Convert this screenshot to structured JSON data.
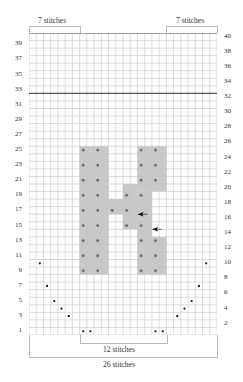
{
  "chart_title": "Knitting chart",
  "grid": {
    "columns": 26,
    "rows": 40,
    "thick_lines_above_rows": [
      40,
      32
    ],
    "shade_color": "#c8c8c8",
    "line_color": "#c4c4c4",
    "thick_line_color": "#555555"
  },
  "top_labels": {
    "left": "7 stitches",
    "right": "7 stitches"
  },
  "bottom_labels": {
    "inner": "12 stitches",
    "outer": "26 stitches"
  },
  "row_numbers_left": [
    "39",
    "37",
    "35",
    "33",
    "31",
    "29",
    "27",
    "25",
    "23",
    "21",
    "19",
    "17",
    "15",
    "13",
    "11",
    "9",
    "7",
    "5",
    "3",
    "1"
  ],
  "row_numbers_right": [
    "40",
    "38",
    "36",
    "34",
    "32",
    "30",
    "28",
    "26",
    "24",
    "22",
    "20",
    "18",
    "16",
    "14",
    "12",
    "10",
    "8",
    "6",
    "4",
    "2"
  ],
  "shaded_cells": {
    "left_bar": {
      "cols": [
        8,
        11
      ],
      "rows": [
        9,
        25
      ]
    },
    "right_bar_top": {
      "cols": [
        16,
        19
      ],
      "rows": [
        20,
        25
      ]
    },
    "right_bar_bottom": {
      "cols": [
        16,
        19
      ],
      "rows": [
        9,
        13
      ]
    },
    "middle_a": {
      "cols": [
        16,
        17
      ],
      "rows": [
        14,
        19
      ]
    },
    "middle_b": {
      "cols": [
        14,
        15
      ],
      "rows": [
        15,
        20
      ]
    },
    "middle_c": {
      "cols": [
        12,
        13
      ],
      "rows": [
        17,
        18
      ]
    }
  },
  "dots_gray": [
    [
      8,
      25
    ],
    [
      10,
      25
    ],
    [
      16,
      25
    ],
    [
      18,
      25
    ],
    [
      8,
      23
    ],
    [
      10,
      23
    ],
    [
      16,
      23
    ],
    [
      18,
      23
    ],
    [
      8,
      21
    ],
    [
      10,
      21
    ],
    [
      16,
      21
    ],
    [
      18,
      21
    ],
    [
      8,
      19
    ],
    [
      10,
      19
    ],
    [
      14,
      19
    ],
    [
      16,
      19
    ],
    [
      8,
      17
    ],
    [
      10,
      17
    ],
    [
      12,
      17
    ],
    [
      14,
      17
    ],
    [
      8,
      15
    ],
    [
      10,
      15
    ],
    [
      14,
      15
    ],
    [
      16,
      15
    ],
    [
      8,
      13
    ],
    [
      10,
      13
    ],
    [
      16,
      13
    ],
    [
      18,
      13
    ],
    [
      8,
      11
    ],
    [
      10,
      11
    ],
    [
      16,
      11
    ],
    [
      18,
      11
    ],
    [
      8,
      9
    ],
    [
      10,
      9
    ],
    [
      16,
      9
    ],
    [
      18,
      9
    ]
  ],
  "dots_black": [
    [
      2,
      10
    ],
    [
      3,
      7
    ],
    [
      4,
      5
    ],
    [
      5,
      4
    ],
    [
      6,
      3
    ],
    [
      8,
      1
    ],
    [
      9,
      1
    ],
    [
      25,
      10
    ],
    [
      24,
      7
    ],
    [
      23,
      5
    ],
    [
      22,
      4
    ],
    [
      21,
      3
    ],
    [
      19,
      1
    ],
    [
      18,
      1
    ]
  ],
  "arrows": [
    {
      "col": 16,
      "row": 16,
      "direction": "left"
    },
    {
      "col": 18,
      "row": 14,
      "direction": "left"
    }
  ]
}
